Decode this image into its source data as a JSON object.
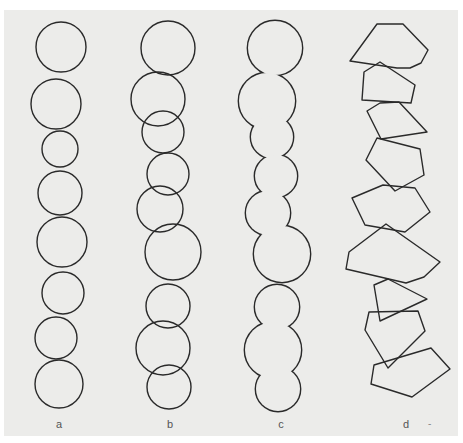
{
  "figure": {
    "background": "#ececea",
    "stroke": "#2a2a2a",
    "panels": [
      {
        "id": "a",
        "label": "a",
        "label_x": 59,
        "description": "separate non-overlapping circles",
        "circles": [
          {
            "cx": 61,
            "cy": 47,
            "r": 25
          },
          {
            "cx": 56,
            "cy": 104,
            "r": 25
          },
          {
            "cx": 60,
            "cy": 149,
            "r": 18
          },
          {
            "cx": 60,
            "cy": 193,
            "r": 22
          },
          {
            "cx": 62,
            "cy": 242,
            "r": 25
          },
          {
            "cx": 63,
            "cy": 293,
            "r": 21
          },
          {
            "cx": 56,
            "cy": 338,
            "r": 21
          },
          {
            "cx": 59,
            "cy": 384,
            "r": 24
          }
        ]
      },
      {
        "id": "b",
        "label": "b",
        "label_x": 170,
        "description": "overlapping circles",
        "circles": [
          {
            "cx": 168,
            "cy": 48,
            "r": 27
          },
          {
            "cx": 158,
            "cy": 99,
            "r": 27
          },
          {
            "cx": 163,
            "cy": 132,
            "r": 21
          },
          {
            "cx": 168,
            "cy": 174,
            "r": 21
          },
          {
            "cx": 160,
            "cy": 209,
            "r": 23
          },
          {
            "cx": 173,
            "cy": 252,
            "r": 28
          },
          {
            "cx": 168,
            "cy": 306,
            "r": 22
          },
          {
            "cx": 163,
            "cy": 348,
            "r": 27
          },
          {
            "cx": 169,
            "cy": 387,
            "r": 22
          }
        ]
      },
      {
        "id": "c",
        "label": "c",
        "label_x": 281,
        "description": "union outline of overlapping circles",
        "circles": [
          {
            "cx": 275,
            "cy": 48,
            "r": 27
          },
          {
            "cx": 267,
            "cy": 101,
            "r": 28
          },
          {
            "cx": 272,
            "cy": 137,
            "r": 21
          },
          {
            "cx": 276,
            "cy": 176,
            "r": 21
          },
          {
            "cx": 268,
            "cy": 213,
            "r": 22
          },
          {
            "cx": 282,
            "cy": 254,
            "r": 28
          },
          {
            "cx": 277,
            "cy": 307,
            "r": 22
          },
          {
            "cx": 273,
            "cy": 350,
            "r": 28
          },
          {
            "cx": 278,
            "cy": 389,
            "r": 22
          }
        ]
      },
      {
        "id": "d",
        "label": "d",
        "label_x": 406,
        "description": "overlapping irregular polygons",
        "polygons": [
          "377,24 403,24 428,50 421,63 410,68 397,68 350,61",
          "380,62 364,72 362,100 411,103 415,85",
          "380,103 367,111 381,139 427,132 399,102",
          "377,138 366,160 395,191 424,175 420,149",
          "352,198 383,185 415,188 430,212 405,232 365,225",
          "386,224 349,252 346,269 406,283 424,277 440,262",
          "374,285 388,279 427,299 380,321",
          "369,312 418,311 425,331 388,368 365,330",
          "374,365 431,348 450,369 412,397 371,384"
        ]
      }
    ],
    "stray_mark": "-"
  }
}
